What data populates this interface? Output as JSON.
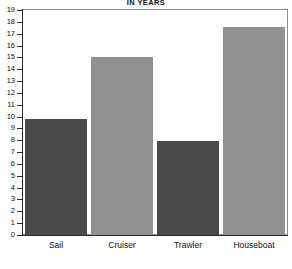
{
  "chart_data": {
    "type": "bar",
    "title": "IN YEARS",
    "xlabel": "",
    "ylabel": "",
    "categories": [
      "Sail",
      "Cruiser",
      "Trawler",
      "Houseboat"
    ],
    "values": [
      9.8,
      15,
      7.9,
      17.6
    ],
    "ylim": [
      0,
      19
    ],
    "ytick_labels": [
      "19",
      "18",
      "17",
      "16",
      "15",
      "14",
      "13",
      "12",
      "11",
      "10",
      "9",
      "8",
      "7",
      "6",
      "5",
      "4",
      "3",
      "2",
      "1",
      "0"
    ],
    "ytick_values": [
      19,
      18,
      17,
      16,
      15,
      14,
      13,
      12,
      11,
      10,
      9,
      8,
      7,
      6,
      5,
      4,
      3,
      2,
      1,
      0
    ],
    "grid": false,
    "legend": null,
    "bar_colors": [
      "#4a4a4a",
      "#909090",
      "#4a4a4a",
      "#909090"
    ],
    "series": [
      {
        "name": "Years",
        "values": [
          9.8,
          15,
          7.9,
          17.6
        ]
      }
    ]
  },
  "style": {
    "frame_color": "#8c8c8c",
    "axis_color": "#2b2b2b",
    "background": "#ffffff",
    "dark_bar": "#4a4a4a",
    "light_bar": "#909090"
  }
}
